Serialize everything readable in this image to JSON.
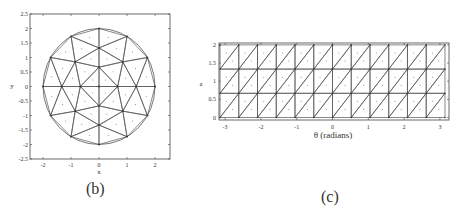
{
  "panels": {
    "b": {
      "caption": "(b)",
      "xlabel": "x",
      "ylabel": "y",
      "xticks": [
        "-2",
        "-1",
        "0",
        "1",
        "2"
      ],
      "yticks": [
        "2.5",
        "2",
        "1.5",
        "1",
        "0.5",
        "0",
        "-0.5",
        "-1",
        "-1.5",
        "-2",
        "-2.5"
      ]
    },
    "c": {
      "caption": "(c)",
      "xlabel": "θ  (radians)",
      "ylabel": "z",
      "xticks": [
        "-3",
        "-2",
        "-1",
        "0",
        "1",
        "2",
        "3"
      ],
      "yticks": [
        "2",
        "1.5",
        "1",
        "0.5",
        "0"
      ]
    }
  },
  "chart_data": [
    {
      "type": "scatter",
      "title": "(b) triangular mesh of disk",
      "xlabel": "x",
      "ylabel": "y",
      "xlim": [
        -2.5,
        2.5
      ],
      "ylim": [
        -2.5,
        2.5
      ],
      "grid": false,
      "description": "Disk of radius 2 triangulated into 36 triangles; dots mark triangle centroids",
      "vertices": {
        "center": [
          [
            0,
            0
          ]
        ],
        "inner_ring_r0.667": [
          [
            0,
            0.667
          ],
          [
            0.667,
            0
          ],
          [
            0,
            -0.667
          ],
          [
            -0.667,
            0
          ]
        ],
        "middle_ring": [
          [
            0,
            1.33
          ],
          [
            0.85,
            0.85
          ],
          [
            1.33,
            0
          ],
          [
            0.85,
            -0.85
          ],
          [
            0,
            -1.33
          ],
          [
            -0.85,
            -0.85
          ],
          [
            -1.33,
            0
          ],
          [
            -0.85,
            0.85
          ]
        ],
        "outer_ring_r2": [
          [
            0,
            2
          ],
          [
            1,
            1.73
          ],
          [
            1.73,
            1
          ],
          [
            2,
            0
          ],
          [
            1.73,
            -1
          ],
          [
            1,
            -1.73
          ],
          [
            0,
            -2
          ],
          [
            -1,
            -1.73
          ],
          [
            -1.73,
            -1
          ],
          [
            -2,
            0
          ],
          [
            -1.73,
            1
          ],
          [
            -1,
            1.73
          ]
        ]
      }
    },
    {
      "type": "scatter",
      "title": "(c) triangular mesh of cylinder surface (unrolled)",
      "xlabel": "θ (radians)",
      "ylabel": "z",
      "xlim": [
        -3.14,
        3.14
      ],
      "ylim": [
        0,
        2
      ],
      "grid": false,
      "description": "12 columns × 3 rows of rectangles each split by a diagonal into 2 triangles (72 triangles); dots mark centroids",
      "columns": 12,
      "rows": 3
    }
  ]
}
